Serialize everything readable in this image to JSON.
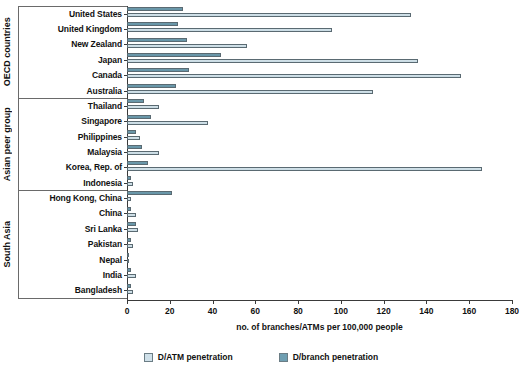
{
  "chart_data": {
    "type": "bar",
    "orientation": "horizontal",
    "title": "",
    "xlabel": "no. of branches/ATMs per 100,000 people",
    "ylabel": "",
    "xlim": [
      0,
      180
    ],
    "xticks": [
      0,
      20,
      40,
      60,
      80,
      100,
      120,
      140,
      160,
      180
    ],
    "grid": false,
    "legend_position": "bottom-center",
    "categories": [
      "United States",
      "United Kingdom",
      "New Zealand",
      "Japan",
      "Canada",
      "Australia",
      "Thailand",
      "Singapore",
      "Philippines",
      "Malaysia",
      "Korea, Rep. of",
      "Indonesia",
      "Hong Kong, China",
      "China",
      "Sri Lanka",
      "Pakistan",
      "Nepal",
      "India",
      "Bangladesh"
    ],
    "series": [
      {
        "name": "D/ATM penetration",
        "color": "#cfe0e9",
        "values": [
          133,
          96,
          56,
          136,
          156,
          115,
          15,
          38,
          6,
          15,
          166,
          3,
          2,
          4,
          5,
          3,
          1,
          4,
          3
        ]
      },
      {
        "name": "D/branch penetration",
        "color": "#6f9fb2",
        "values": [
          26,
          24,
          28,
          44,
          29,
          23,
          8,
          11,
          4,
          7,
          10,
          2,
          21,
          2,
          4,
          2,
          1,
          2,
          2
        ]
      }
    ],
    "groups": [
      {
        "label": "OECD countries",
        "start": 0,
        "end": 5
      },
      {
        "label": "Asian peer group",
        "start": 6,
        "end": 11
      },
      {
        "label": "South Asia",
        "start": 12,
        "end": 18
      }
    ]
  },
  "legend": {
    "items": [
      {
        "label": "D/ATM penetration",
        "key": "atm"
      },
      {
        "label": "D/branch penetration",
        "key": "branch"
      }
    ]
  }
}
